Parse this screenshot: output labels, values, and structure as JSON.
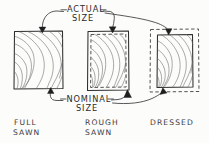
{
  "diagram": {
    "background_color": "#fcfcfb",
    "ink_color": "#2e2e2e",
    "callouts": {
      "actual": {
        "line1": "ACTUAL",
        "line2": "SIZE",
        "full_text": "ACTUAL SIZE",
        "position": "top-center",
        "leader_count": 3
      },
      "nominal": {
        "line1": "NOMINAL",
        "line2": "SIZE",
        "full_text": "NOMINAL SIZE",
        "position": "bottom-center",
        "leader_count": 3
      }
    },
    "specimens": [
      {
        "id": "full-sawn",
        "label_line1": "FULL",
        "label_line2": "SAWN",
        "full_label": "FULL SAWN",
        "order": 1,
        "has_solid_outline": true,
        "has_dashed_outline": false,
        "dashed_role": "none",
        "description": "Actual size equals nominal size; single solid boundary.",
        "actual_edge": "solid-outer",
        "nominal_edge": "solid-outer"
      },
      {
        "id": "rough-sawn",
        "label_line1": "ROUGH",
        "label_line2": "SAWN",
        "full_label": "ROUGH SAWN",
        "order": 2,
        "has_solid_outline": true,
        "has_dashed_outline": true,
        "dashed_role": "inner-nominal",
        "description": "Solid outer actual size slightly larger than dashed inner nominal size.",
        "actual_edge": "solid-outer",
        "nominal_edge": "dashed-inner"
      },
      {
        "id": "dressed",
        "label_line1": "DRESSED",
        "label_line2": "",
        "full_label": "DRESSED",
        "order": 3,
        "has_solid_outline": true,
        "has_dashed_outline": true,
        "dashed_role": "outer-nominal",
        "description": "Dashed outer nominal size noticeably larger than solid inner actual size.",
        "actual_edge": "solid-inner",
        "nominal_edge": "dashed-outer"
      }
    ]
  }
}
